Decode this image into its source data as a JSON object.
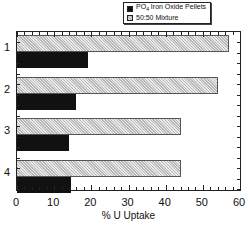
{
  "chart_data": {
    "type": "bar",
    "orientation": "horizontal",
    "title": "",
    "xlabel": "% U Uptake",
    "ylabel": "",
    "categories": [
      "1",
      "2",
      "3",
      "4"
    ],
    "series": [
      {
        "name": "PO4 Iron Oxide Pellets",
        "fill": "solid-black",
        "color": "#111111",
        "values": [
          19,
          16,
          14,
          14.5
        ]
      },
      {
        "name": "50:50 Mixture",
        "fill": "hatched-gray",
        "color": "#d6d6d6",
        "values": [
          57,
          54,
          44,
          44
        ]
      }
    ],
    "xlim": [
      0,
      60
    ],
    "xticks": [
      0,
      10,
      20,
      30,
      40,
      50,
      60
    ],
    "grid": false,
    "legend_position": "top-right-outside"
  },
  "legend": {
    "items": [
      {
        "label_main": "PO",
        "label_sub": "4",
        "label_rest": " Iron Oxide Pellets"
      },
      {
        "label": "50:50 Mixture"
      }
    ]
  },
  "axes": {
    "x_tick_labels": [
      "0",
      "10",
      "20",
      "30",
      "40",
      "50",
      "60"
    ],
    "y_tick_labels": [
      "1",
      "2",
      "3",
      "4"
    ],
    "x_title": "% U Uptake"
  }
}
